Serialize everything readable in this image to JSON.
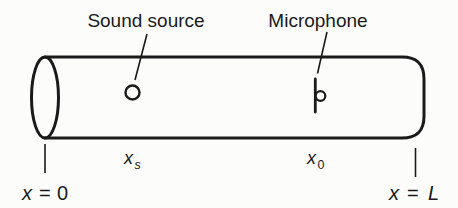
{
  "figure": {
    "labels": {
      "sound_source": "Sound source",
      "microphone": "Microphone"
    },
    "positions": {
      "xs": {
        "var": "x",
        "sub": "s"
      },
      "x0": {
        "var": "x",
        "sub": "0"
      }
    },
    "axis": {
      "left": {
        "var": "x",
        "eq": "=",
        "val": "0"
      },
      "right": {
        "var": "x",
        "eq": "=",
        "val": "L"
      }
    },
    "colors": {
      "ink": "#1a1a1a",
      "paper": "#fcfcfa"
    }
  }
}
